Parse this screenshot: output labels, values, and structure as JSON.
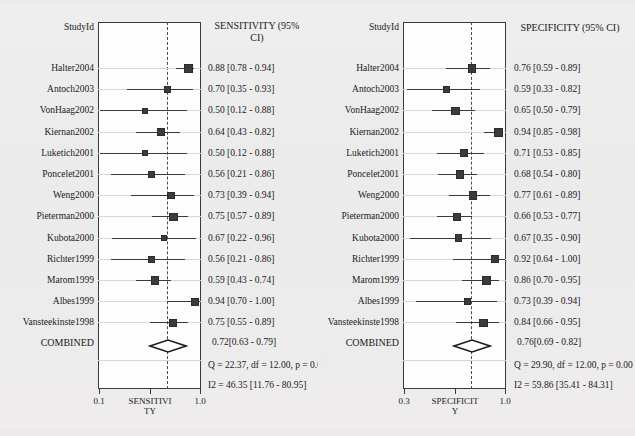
{
  "figure": {
    "type": "forest-plot-pair",
    "background_color": "#ebebeb",
    "plot_background_color": "#fdfdfd",
    "marker_color": "#3b3b3b",
    "axis_color": "#3a3a3a"
  },
  "left_panel": {
    "study_header": "StudyId",
    "metric_header_line1": "SENSITIVITY (95%",
    "metric_header_line2": "CI)",
    "combined_label": "COMBINED",
    "combined_ci": "0.72[0.63 - 0.79]",
    "q_line": "Q = 22.37, df = 12.00, p =  0.0",
    "i2_line": "I2 = 46.35 [11.76 - 80.95]",
    "axis_title_line1": "SENSITIVI",
    "axis_title_line2": "TY",
    "axis_min_label": "0.1",
    "axis_max_label": "1.0"
  },
  "right_panel": {
    "study_header": "StudyId",
    "metric_header_line1": "SPECIFICITY (95% CI)",
    "metric_header_line2": "",
    "combined_label": "COMBINED",
    "combined_ci": "0.76[0.69 - 0.82]",
    "q_line": "Q = 29.90, df = 12.00, p =  0.00",
    "i2_line": "I2 = 59.86 [35.41 - 84.31]",
    "axis_title_line1": "SPECIFICIT",
    "axis_title_line2": "Y",
    "axis_min_label": "0.3",
    "axis_max_label": "1.0"
  },
  "chart_data": {
    "type": "forest",
    "title": "",
    "panels": [
      {
        "name": "SENSITIVITY",
        "xlabel": "SENSITIVITY",
        "ylabel": "StudyId",
        "xlim": [
          0.1,
          1.0
        ],
        "xticks": [
          0.1,
          1.0
        ],
        "xticklabels": [
          "0.1",
          "1.0"
        ],
        "grid": true,
        "pooled": {
          "label": "COMBINED",
          "estimate": 0.72,
          "ci_low": 0.63,
          "ci_high": 0.79,
          "text": "0.72[0.63 - 0.79]"
        },
        "heterogeneity": {
          "Q": 22.37,
          "df": 12.0,
          "p_text": "0.0",
          "I2": 46.35,
          "I2_ci_low": 11.76,
          "I2_ci_high": 80.95,
          "q_text": "Q = 22.37, df = 12.00, p =  0.0",
          "i2_text": "I2 = 46.35 [11.76 - 80.95]"
        },
        "studies": [
          {
            "id": "Halter2004",
            "estimate": 0.88,
            "ci_low": 0.78,
            "ci_high": 0.94,
            "text": "0.88 [0.78 - 0.94]"
          },
          {
            "id": "Antoch2003",
            "estimate": 0.7,
            "ci_low": 0.35,
            "ci_high": 0.93,
            "text": "0.70 [0.35 - 0.93]"
          },
          {
            "id": "VonHaag2002",
            "estimate": 0.5,
            "ci_low": 0.12,
            "ci_high": 0.88,
            "text": "0.50 [0.12 - 0.88]"
          },
          {
            "id": "Kiernan2002",
            "estimate": 0.64,
            "ci_low": 0.43,
            "ci_high": 0.82,
            "text": "0.64 [0.43 - 0.82]"
          },
          {
            "id": "Luketich2001",
            "estimate": 0.5,
            "ci_low": 0.12,
            "ci_high": 0.88,
            "text": "0.50 [0.12 - 0.88]"
          },
          {
            "id": "Poncelet2001",
            "estimate": 0.56,
            "ci_low": 0.21,
            "ci_high": 0.86,
            "text": "0.56 [0.21 - 0.86]"
          },
          {
            "id": "Weng2000",
            "estimate": 0.73,
            "ci_low": 0.39,
            "ci_high": 0.94,
            "text": "0.73 [0.39 - 0.94]"
          },
          {
            "id": "Pieterman2000",
            "estimate": 0.75,
            "ci_low": 0.57,
            "ci_high": 0.89,
            "text": "0.75 [0.57 - 0.89]"
          },
          {
            "id": "Kubota2000",
            "estimate": 0.67,
            "ci_low": 0.22,
            "ci_high": 0.96,
            "text": "0.67 [0.22 - 0.96]"
          },
          {
            "id": "Richter1999",
            "estimate": 0.56,
            "ci_low": 0.21,
            "ci_high": 0.86,
            "text": "0.56 [0.21 - 0.86]"
          },
          {
            "id": "Marom1999",
            "estimate": 0.59,
            "ci_low": 0.43,
            "ci_high": 0.74,
            "text": "0.59 [0.43 - 0.74]"
          },
          {
            "id": "Albes1999",
            "estimate": 0.94,
            "ci_low": 0.7,
            "ci_high": 1.0,
            "text": "0.94 [0.70 - 1.00]"
          },
          {
            "id": "Vansteekinste1998",
            "estimate": 0.75,
            "ci_low": 0.55,
            "ci_high": 0.89,
            "text": "0.75 [0.55 - 0.89]"
          }
        ]
      },
      {
        "name": "SPECIFICITY",
        "xlabel": "SPECIFICITY",
        "ylabel": "StudyId",
        "xlim": [
          0.3,
          1.0
        ],
        "xticks": [
          0.3,
          1.0
        ],
        "xticklabels": [
          "0.3",
          "1.0"
        ],
        "grid": true,
        "pooled": {
          "label": "COMBINED",
          "estimate": 0.76,
          "ci_low": 0.69,
          "ci_high": 0.82,
          "text": "0.76[0.69 - 0.82]"
        },
        "heterogeneity": {
          "Q": 29.9,
          "df": 12.0,
          "p_text": "0.00",
          "I2": 59.86,
          "I2_ci_low": 35.41,
          "I2_ci_high": 84.31,
          "q_text": "Q = 29.90, df = 12.00, p =  0.00",
          "i2_text": "I2 = 59.86 [35.41 - 84.31]"
        },
        "studies": [
          {
            "id": "Halter2004",
            "estimate": 0.76,
            "ci_low": 0.59,
            "ci_high": 0.89,
            "text": "0.76 [0.59 - 0.89]"
          },
          {
            "id": "Antoch2003",
            "estimate": 0.59,
            "ci_low": 0.33,
            "ci_high": 0.82,
            "text": "0.59 [0.33 - 0.82]"
          },
          {
            "id": "VonHaag2002",
            "estimate": 0.65,
            "ci_low": 0.5,
            "ci_high": 0.79,
            "text": "0.65 [0.50 - 0.79]"
          },
          {
            "id": "Kiernan2002",
            "estimate": 0.94,
            "ci_low": 0.85,
            "ci_high": 0.98,
            "text": "0.94 [0.85 - 0.98]"
          },
          {
            "id": "Luketich2001",
            "estimate": 0.71,
            "ci_low": 0.53,
            "ci_high": 0.85,
            "text": "0.71 [0.53 - 0.85]"
          },
          {
            "id": "Poncelet2001",
            "estimate": 0.68,
            "ci_low": 0.54,
            "ci_high": 0.8,
            "text": "0.68 [0.54 - 0.80]"
          },
          {
            "id": "Weng2000",
            "estimate": 0.77,
            "ci_low": 0.61,
            "ci_high": 0.89,
            "text": "0.77 [0.61 - 0.89]"
          },
          {
            "id": "Pieterman2000",
            "estimate": 0.66,
            "ci_low": 0.53,
            "ci_high": 0.77,
            "text": "0.66 [0.53 - 0.77]"
          },
          {
            "id": "Kubota2000",
            "estimate": 0.67,
            "ci_low": 0.35,
            "ci_high": 0.9,
            "text": "0.67 [0.35 - 0.90]"
          },
          {
            "id": "Richter1999",
            "estimate": 0.92,
            "ci_low": 0.64,
            "ci_high": 1.0,
            "text": "0.92 [0.64 - 1.00]"
          },
          {
            "id": "Marom1999",
            "estimate": 0.86,
            "ci_low": 0.7,
            "ci_high": 0.95,
            "text": "0.86 [0.70 - 0.95]"
          },
          {
            "id": "Albes1999",
            "estimate": 0.73,
            "ci_low": 0.39,
            "ci_high": 0.94,
            "text": "0.73 [0.39 - 0.94]"
          },
          {
            "id": "Vansteekinste1998",
            "estimate": 0.84,
            "ci_low": 0.66,
            "ci_high": 0.95,
            "text": "0.84 [0.66 - 0.95]"
          }
        ]
      }
    ]
  }
}
